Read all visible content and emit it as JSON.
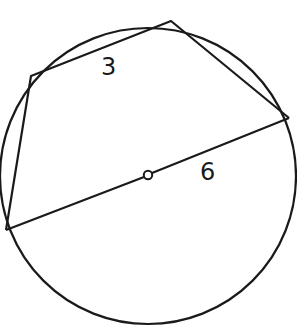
{
  "diagram": {
    "type": "inscribed-quadrilateral",
    "circle": {
      "cx": 148,
      "cy": 176,
      "r": 148
    },
    "center_marker": {
      "cx": 148,
      "cy": 175,
      "r": 4
    },
    "vertices": {
      "A": {
        "x": 6,
        "y": 230
      },
      "B": {
        "x": 31,
        "y": 76
      },
      "C": {
        "x": 171,
        "y": 21
      },
      "D": {
        "x": 289,
        "y": 118
      }
    },
    "labels": {
      "top_side": "3",
      "diameter": "6"
    },
    "stroke_color": "#1a1a1a"
  }
}
